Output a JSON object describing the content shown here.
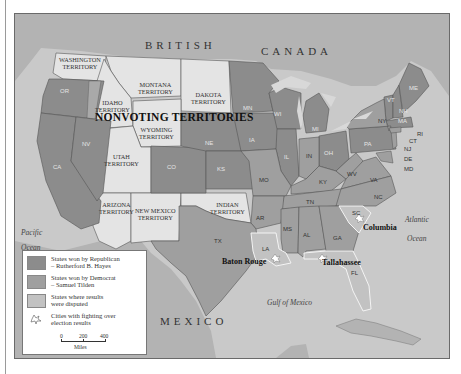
{
  "map": {
    "title": "NONVOTING TERRITORIES",
    "colors": {
      "republican": "#8c8c8c",
      "democrat": "#9f9f9f",
      "disputed": "#c2c2c2",
      "territory": "#e4e4e4",
      "water": "#c9c9c9",
      "foreign_land": "#b3b3b3",
      "lakes": "#d8d8d8"
    },
    "countries": {
      "north": "BRITISH CANADA",
      "north_left": "BRITISH",
      "north_right": "CANADA",
      "south": "MEXICO"
    },
    "oceans": {
      "pacific_1": "Pacific",
      "pacific_2": "Ocean",
      "atlantic_1": "Atlantic",
      "atlantic_2": "Ocean",
      "gulf": "Gulf of Mexico"
    },
    "territories": {
      "washington": [
        "WASHINGTON",
        "TERRITORY"
      ],
      "montana": [
        "MONTANA",
        "TERRITORY"
      ],
      "dakota": [
        "DAKOTA",
        "TERRITORY"
      ],
      "idaho": [
        "IDAHO",
        "TERRITORY"
      ],
      "wyoming": [
        "WYOMING",
        "TERRITORY"
      ],
      "utah": [
        "UTAH",
        "TERRITORY"
      ],
      "arizona": [
        "ARIZONA",
        "TERRITORY"
      ],
      "new_mexico": [
        "NEW MEXICO",
        "TERRITORY"
      ],
      "indian": [
        "INDIAN",
        "TERRITORY"
      ]
    },
    "states": {
      "republican": [
        "OR",
        "CA",
        "NV",
        "CO",
        "NE",
        "KS",
        "MN",
        "IA",
        "WI",
        "MI",
        "IL",
        "OH",
        "PA",
        "VT",
        "NH",
        "ME",
        "MA",
        "RI"
      ],
      "democrat": [
        "MO",
        "TX",
        "AR",
        "MS",
        "AL",
        "GA",
        "TN",
        "KY",
        "IN",
        "WV",
        "VA",
        "NC",
        "NY",
        "NJ",
        "CT",
        "DE",
        "MD"
      ],
      "disputed": [
        "LA",
        "SC",
        "FL"
      ]
    },
    "state_labels": {
      "or": "OR",
      "ca": "CA",
      "nv": "NV",
      "co": "CO",
      "ne": "NE",
      "ks": "KS",
      "mn": "MN",
      "ia": "IA",
      "wi": "WI",
      "mi": "MI",
      "il": "IL",
      "in": "IN",
      "oh": "OH",
      "pa": "PA",
      "ny": "NY",
      "vt": "VT",
      "nh": "NH",
      "me": "ME",
      "ma": "MA",
      "ri": "RI",
      "ct": "CT",
      "nj": "NJ",
      "de": "DE",
      "md": "MD",
      "mo": "MO",
      "ky": "KY",
      "wv": "WV",
      "va": "VA",
      "tn": "TN",
      "nc": "NC",
      "ar": "AR",
      "ms": "MS",
      "al": "AL",
      "ga": "GA",
      "sc": "SC",
      "la": "LA",
      "fl": "FL",
      "tx": "TX"
    },
    "cities": {
      "columbia": "Columbia",
      "baton_rouge": "Baton Rouge",
      "tallahassee": "Tallahassee"
    }
  },
  "legend": {
    "items": [
      {
        "label_1": "States won by Republican",
        "label_2": "– Rutherford B. Hayes",
        "color": "#8c8c8c"
      },
      {
        "label_1": "States won by Democrat",
        "label_2": "– Samuel Tilden",
        "color": "#9f9f9f"
      },
      {
        "label_1": "States where results",
        "label_2": "were disputed",
        "color": "#c2c2c2"
      },
      {
        "label_1": "Cities with fighting over",
        "label_2": "election results",
        "icon": "explosion-icon"
      }
    ],
    "scale": {
      "ticks": [
        "0",
        "200",
        "400"
      ],
      "unit": "Miles"
    }
  }
}
